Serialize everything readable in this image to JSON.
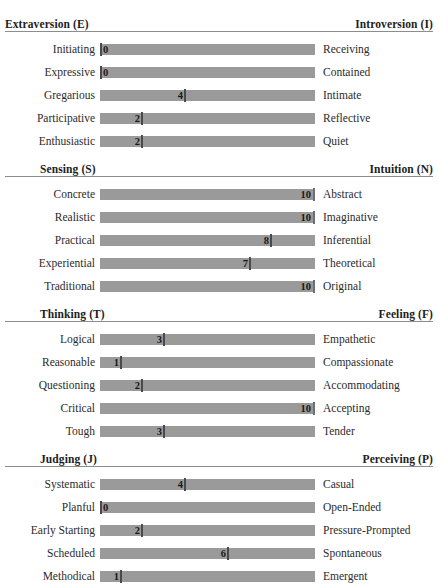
{
  "document": {
    "bleed_top": [
      "",
      "",
      ""
    ]
  },
  "scale": {
    "min": 0,
    "max": 10
  },
  "chart_data": {
    "type": "bar",
    "title": "",
    "xlabel": "",
    "ylabel": "",
    "xlim": [
      0,
      10
    ],
    "grid": false,
    "legend": "none",
    "orientation": "horizontal",
    "note": "Bipolar facet scores; each row's value marks the position along a 0-10 track running from the left pole to the right pole.",
    "sections": [
      {
        "left_pole": "Extraversion (E)",
        "right_pole": "Introversion (I)",
        "categories": [
          "Initiating",
          "Expressive",
          "Gregarious",
          "Participative",
          "Enthusiastic"
        ],
        "opposites": [
          "Receiving",
          "Contained",
          "Intimate",
          "Reflective",
          "Quiet"
        ],
        "values": [
          0,
          0,
          4,
          2,
          2
        ]
      },
      {
        "left_pole": "Sensing (S)",
        "right_pole": "Intuition (N)",
        "categories": [
          "Concrete",
          "Realistic",
          "Practical",
          "Experiential",
          "Traditional"
        ],
        "opposites": [
          "Abstract",
          "Imaginative",
          "Inferential",
          "Theoretical",
          "Original"
        ],
        "values": [
          10,
          10,
          8,
          7,
          10
        ]
      },
      {
        "left_pole": "Thinking (T)",
        "right_pole": "Feeling (F)",
        "categories": [
          "Logical",
          "Reasonable",
          "Questioning",
          "Critical",
          "Tough"
        ],
        "opposites": [
          "Empathetic",
          "Compassionate",
          "Accommodating",
          "Accepting",
          "Tender"
        ],
        "values": [
          3,
          1,
          2,
          10,
          3
        ]
      },
      {
        "left_pole": "Judging (J)",
        "right_pole": "Perceiving (P)",
        "categories": [
          "Systematic",
          "Planful",
          "Early Starting",
          "Scheduled",
          "Methodical"
        ],
        "opposites": [
          "Casual",
          "Open-Ended",
          "Pressure-Prompted",
          "Spontaneous",
          "Emergent"
        ],
        "values": [
          4,
          0,
          2,
          6,
          1
        ]
      }
    ]
  },
  "colors": {
    "bar": "#9a9a9a",
    "tick": "#4a4a4a",
    "rule": "#8d8d8d",
    "text": "#2a2a2a",
    "background": "#ffffff"
  },
  "layout": {
    "section_tops": [
      14,
      159,
      304,
      449
    ],
    "head_left_indent": [
      5,
      40,
      40,
      40
    ],
    "rows_offset": 24,
    "row_height": 23,
    "track_left": 100,
    "track_width": 215
  }
}
